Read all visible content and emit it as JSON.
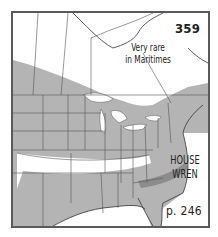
{
  "map": {
    "number": "359",
    "note_line1": "Very rare",
    "note_line2": "in Maritimes",
    "species_line1": "HOUSE",
    "species_line2": "WREN",
    "page_reference": "p. 246"
  },
  "legend_colors": {
    "range_fill": "#b4b4b4",
    "dense_band": "#8c8c8c",
    "border_lines": "#5a5a5a",
    "background": "#ffffff"
  }
}
